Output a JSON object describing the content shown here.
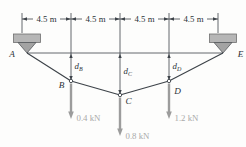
{
  "figure": {
    "dimension_labels": [
      "4.5 m",
      "4.5 m",
      "4.5 m",
      "4.5 m"
    ],
    "point_labels": {
      "a": "A",
      "b": "B",
      "c": "C",
      "d": "D",
      "e": "E"
    },
    "sag_labels": [
      {
        "base": "d",
        "sub": "B"
      },
      {
        "base": "d",
        "sub": "C"
      },
      {
        "base": "d",
        "sub": "D"
      }
    ],
    "loads": [
      {
        "point": "B",
        "label": "0.4 kN"
      },
      {
        "point": "C",
        "label": "0.8 kN"
      },
      {
        "point": "D",
        "label": "1.2 kN"
      }
    ],
    "colors": {
      "line": "#3d4349",
      "support_fill": "#b6b6b6",
      "pin_fill": "#a3a3a3",
      "load_arrow": "#9c9c9c",
      "load_text": "#a9a9a9",
      "background": "#fdfdfc"
    }
  }
}
